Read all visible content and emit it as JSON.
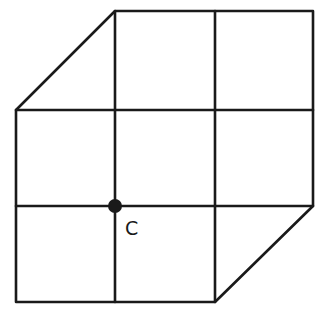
{
  "diagram": {
    "type": "grid-hexagon",
    "stroke_color": "#1a1a1a",
    "background": "#ffffff",
    "grid_x": [
      16,
      115,
      215,
      313
    ],
    "grid_y": [
      11,
      110,
      206,
      302
    ],
    "outline": [
      [
        115,
        11
      ],
      [
        313,
        11
      ],
      [
        313,
        206
      ],
      [
        215,
        302
      ],
      [
        16,
        302
      ],
      [
        16,
        110
      ]
    ],
    "interior_lines": [
      {
        "from": [
          115,
          11
        ],
        "to": [
          115,
          302
        ]
      },
      {
        "from": [
          215,
          11
        ],
        "to": [
          215,
          302
        ]
      },
      {
        "from": [
          16,
          110
        ],
        "to": [
          313,
          110
        ]
      },
      {
        "from": [
          16,
          206
        ],
        "to": [
          313,
          206
        ]
      }
    ],
    "points": [
      {
        "label": "C",
        "x": 115,
        "y": 206,
        "label_x": 126,
        "label_y": 235
      }
    ]
  }
}
